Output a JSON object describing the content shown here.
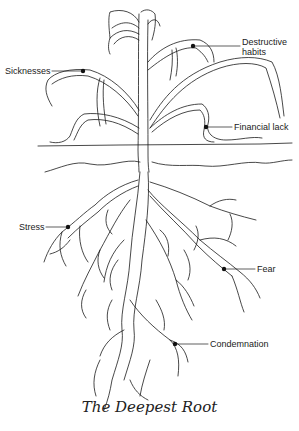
{
  "diagram": {
    "title": "The Deepest Root",
    "colors": {
      "line": "#1a1a1a",
      "background": "#ffffff",
      "text": "#222222"
    },
    "labels": [
      {
        "id": "sicknesses",
        "text": "Sicknesses",
        "part": "leaf"
      },
      {
        "id": "destructive_habits",
        "line1": "Destructive",
        "line2": "habits",
        "part": "leaf"
      },
      {
        "id": "financial_lack",
        "text": "Financial lack",
        "part": "leaf"
      },
      {
        "id": "stress",
        "text": "Stress",
        "part": "root"
      },
      {
        "id": "fear",
        "text": "Fear",
        "part": "root"
      },
      {
        "id": "condemnation",
        "text": "Condemnation",
        "part": "root"
      }
    ]
  }
}
